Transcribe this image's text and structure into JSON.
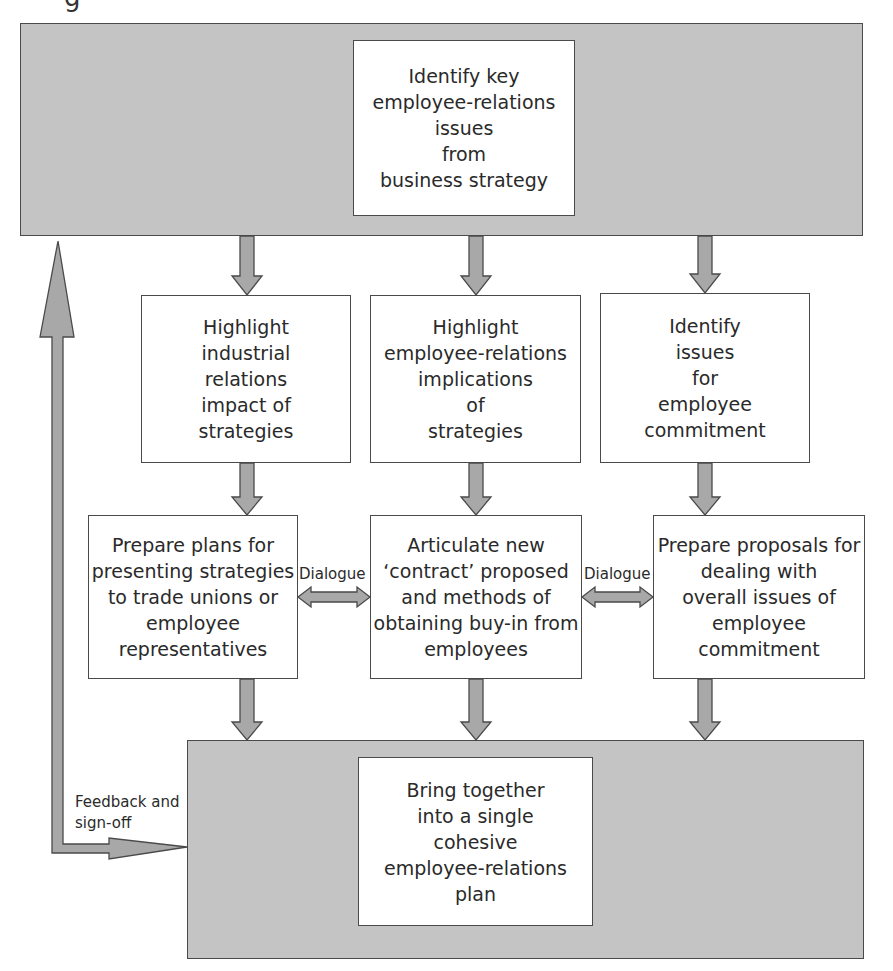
{
  "figure": {
    "cut_caption_glyph": "g"
  },
  "top_box": {
    "lines": [
      "Identify key",
      "employee-relations",
      "issues",
      "from",
      "business strategy"
    ]
  },
  "row2": [
    {
      "lines": [
        "Highlight",
        "industrial",
        "relations",
        "impact of",
        "strategies"
      ]
    },
    {
      "lines": [
        "Highlight",
        "employee-relations",
        "implications",
        "of",
        "strategies"
      ]
    },
    {
      "lines": [
        "Identify",
        "issues",
        "for",
        "employee",
        "commitment"
      ]
    }
  ],
  "row3": [
    {
      "lines": [
        "Prepare plans for",
        "presenting strategies",
        "to trade unions or",
        "employee",
        "representatives"
      ]
    },
    {
      "lines": [
        "Articulate new",
        "‘contract’ proposed",
        "and methods of",
        "obtaining buy-in from",
        "employees"
      ]
    },
    {
      "lines": [
        "Prepare proposals for",
        "dealing with",
        "overall issues of",
        "employee",
        "commitment"
      ]
    }
  ],
  "dialogue_labels": [
    "Dialogue",
    "Dialogue"
  ],
  "feedback_label": [
    "Feedback and",
    "sign-off"
  ],
  "bottom_box": {
    "lines": [
      "Bring together",
      "into a single",
      "cohesive",
      "employee-relations",
      "plan"
    ]
  },
  "colors": {
    "panel_fill": "#c4c4c4",
    "arrow_fill": "#a8a8a8",
    "stroke": "#4a4a4a",
    "text": "#2a2a2a"
  }
}
